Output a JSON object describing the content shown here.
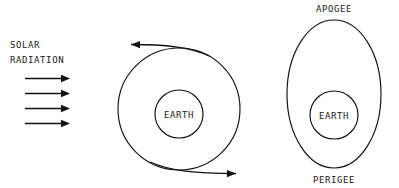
{
  "diagram": {
    "background_color": "#ffffff",
    "ink_color": "#111111"
  },
  "solar_radiation": {
    "label_line_1": "SOLAR",
    "label_line_2": "RADIATION",
    "ray_count": 4,
    "ray_direction": "right"
  },
  "circular_orbit": {
    "earth_label": "EARTH",
    "orbit_shape": "circle",
    "direction_arrow_top": "left",
    "direction_arrow_bottom": "right"
  },
  "elliptical_orbit": {
    "earth_label": "EARTH",
    "orbit_shape": "ellipse",
    "apogee_label": "APOGEE",
    "perigee_label": "PERIGEE"
  }
}
